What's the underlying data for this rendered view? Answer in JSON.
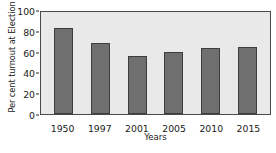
{
  "chart_data": {
    "type": "bar",
    "title": "",
    "subtitle": "",
    "categories": [
      "1950",
      "1997",
      "2001",
      "2005",
      "2010",
      "2015"
    ],
    "values": [
      84,
      70,
      57,
      61,
      65,
      66
    ],
    "xlabel": "Years",
    "ylabel": "Per cent turnout at Election",
    "ylim": [
      0,
      100
    ],
    "yticks": [
      0,
      20,
      40,
      60,
      80,
      100
    ],
    "ytick_labels": [
      "0",
      "20",
      "40",
      "60",
      "80",
      "100"
    ],
    "grid": false,
    "legend": null,
    "annotations": [],
    "colors": {
      "bar_fill": "#6f6f6f",
      "bar_border": "#3d3d3d",
      "plot_background": "#e9e9e9",
      "plot_border": "#4a4a4a",
      "text": "#1a1a1a",
      "page_background": "#ffffff"
    }
  }
}
